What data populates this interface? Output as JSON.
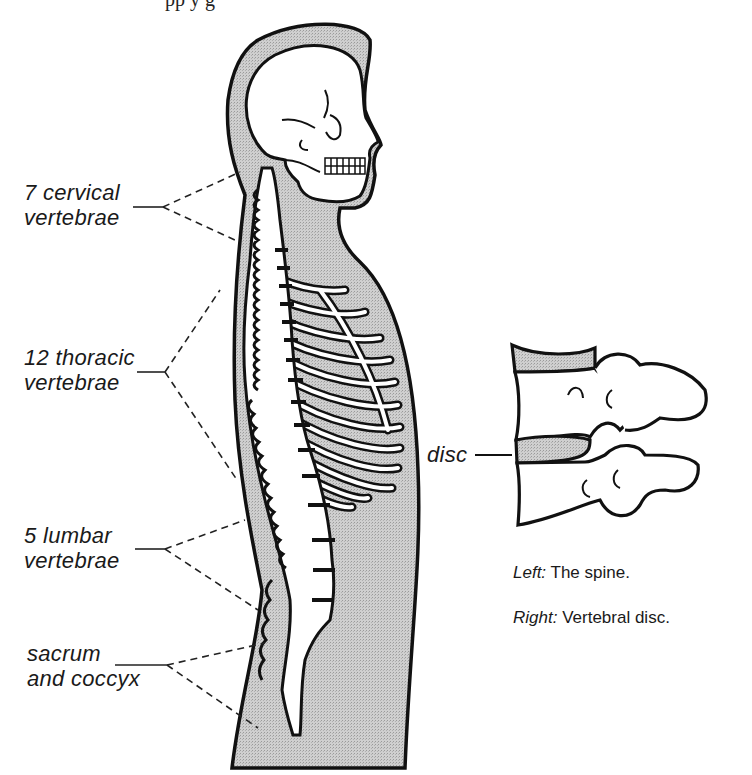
{
  "figure": {
    "top_cut_text": "pp        y g",
    "labels": [
      {
        "id": "cervical",
        "line1": "7 cervical",
        "line2": "vertebrae"
      },
      {
        "id": "thoracic",
        "line1": "12 thoracic",
        "line2": "vertebrae"
      },
      {
        "id": "lumbar",
        "line1": "5 lumbar",
        "line2": "vertebrae"
      },
      {
        "id": "sacrum",
        "line1": "sacrum",
        "line2": "and coccyx"
      }
    ],
    "disc_label": "disc",
    "captions": [
      {
        "prefix": "Left:",
        "text": " The spine."
      },
      {
        "prefix": "Right:",
        "text": " Vertebral disc."
      }
    ],
    "colors": {
      "ink": "#111111",
      "shade": "#c8c8c8",
      "bone": "#ffffff",
      "paper": "#ffffff"
    }
  }
}
